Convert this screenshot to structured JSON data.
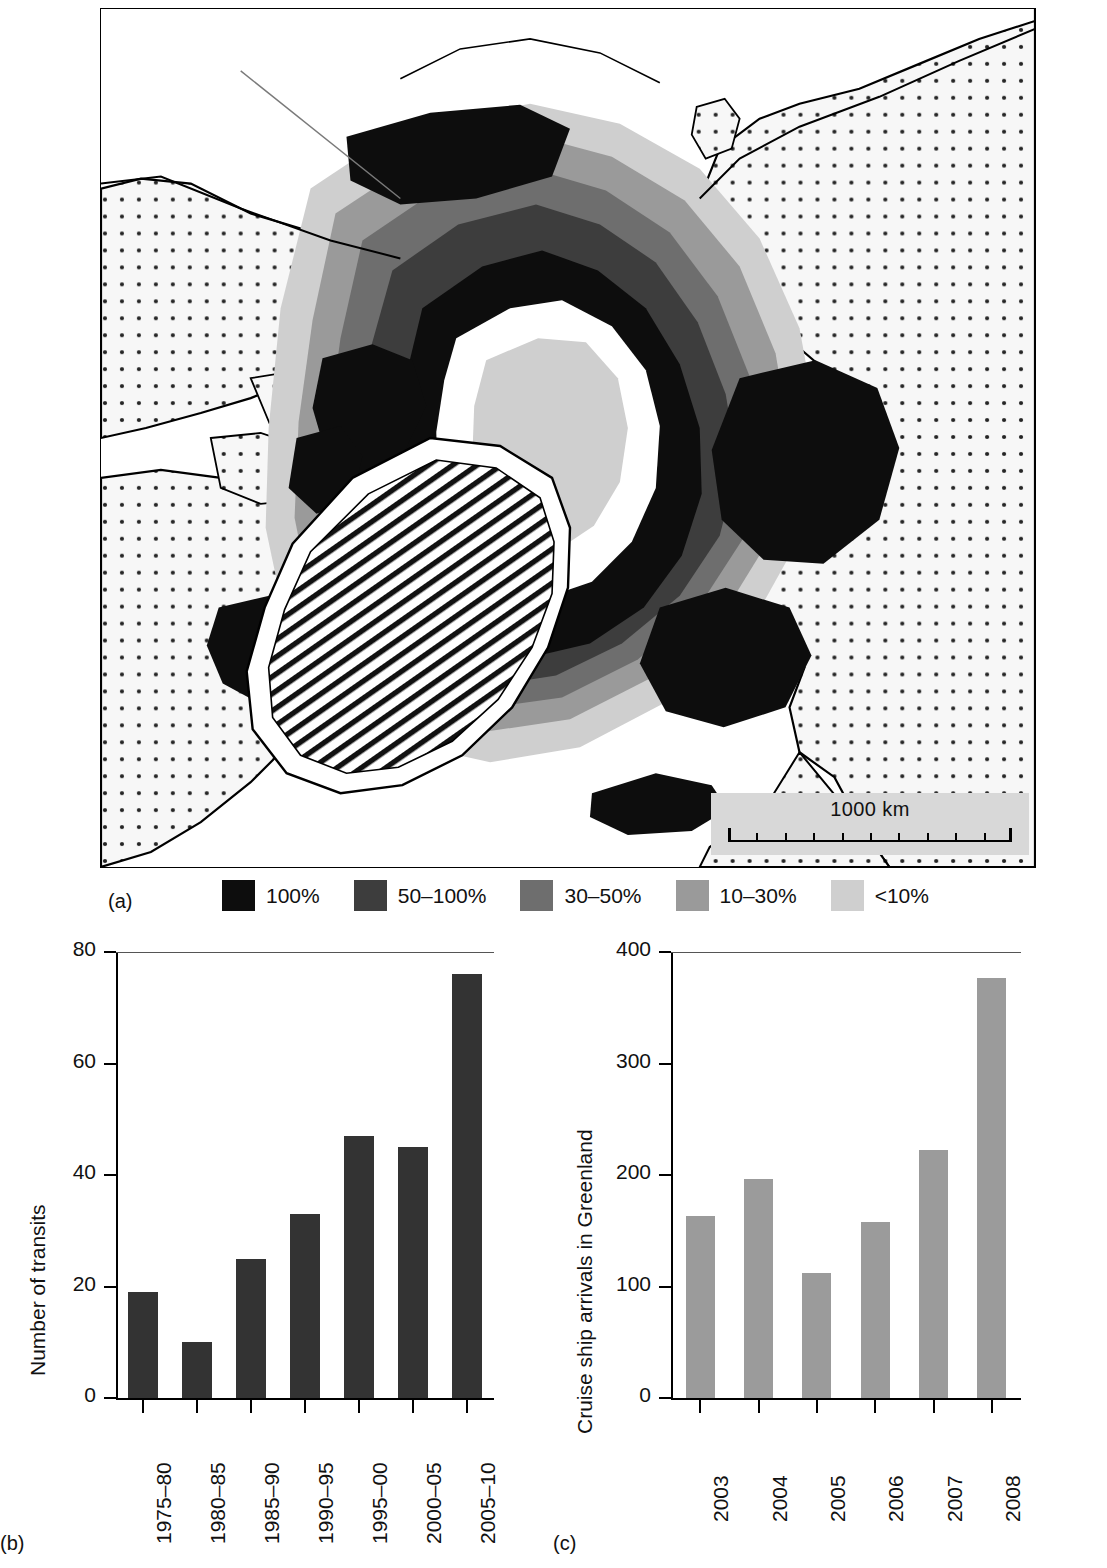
{
  "figure": {
    "panels": [
      {
        "id": "a",
        "label": "(a)"
      },
      {
        "id": "b",
        "label": "(b)"
      },
      {
        "id": "c",
        "label": "(c)"
      }
    ]
  },
  "map": {
    "name": "arctic-sea-ice-concentration-map",
    "scale_bar": {
      "label": "1000 km",
      "tick_count": 10
    },
    "legend_title": "",
    "legend": [
      {
        "label": "100%",
        "color": "#0d0d0d"
      },
      {
        "label": "50–100%",
        "color": "#3d3d3d"
      },
      {
        "label": "30–50%",
        "color": "#6e6e6e"
      },
      {
        "label": "10–30%",
        "color": "#9a9a9a"
      },
      {
        "label": "<10%",
        "color": "#cfcfcf"
      }
    ],
    "patterns": {
      "land_fill": "dotted-stipple",
      "ice_sheet_fill": "diagonal-hatch",
      "open_water_fill": "white"
    }
  },
  "chart_data": [
    {
      "panel": "b",
      "type": "bar",
      "title": "",
      "xlabel": "",
      "ylabel": "Number of transits",
      "categories": [
        "1975–80",
        "1980–85",
        "1985–90",
        "1990–95",
        "1995–00",
        "2000–05",
        "2005–10"
      ],
      "values": [
        19,
        10,
        25,
        33,
        47,
        45,
        76
      ],
      "ylim": [
        0,
        80
      ],
      "yticks": [
        0,
        20,
        40,
        60,
        80
      ],
      "ytick_labels": [
        "0",
        "20",
        "40",
        "60",
        "80"
      ],
      "bar_color": "#333333",
      "grid": false,
      "legend": "none"
    },
    {
      "panel": "c",
      "type": "bar",
      "title": "",
      "xlabel": "",
      "ylabel": "Cruise ship arrivals in Greenland",
      "categories": [
        "2003",
        "2004",
        "2005",
        "2006",
        "2007",
        "2008"
      ],
      "values": [
        163,
        196,
        112,
        158,
        222,
        377
      ],
      "ylim": [
        0,
        400
      ],
      "yticks": [
        0,
        100,
        200,
        300,
        400
      ],
      "ytick_labels": [
        "0",
        "100",
        "200",
        "300",
        "400"
      ],
      "bar_color": "#9b9b9b",
      "grid": false,
      "legend": "none"
    }
  ]
}
